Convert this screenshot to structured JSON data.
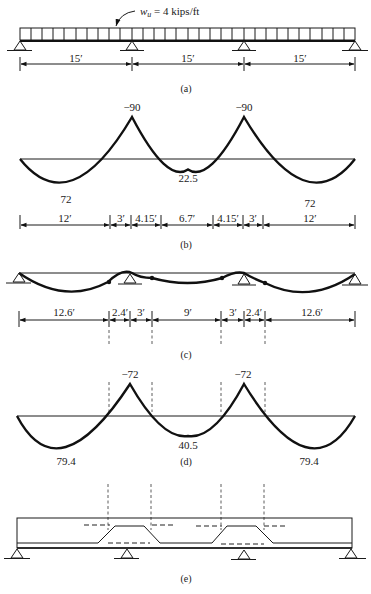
{
  "figure": {
    "a": {
      "caption": "(a)",
      "load_label_w": "w",
      "load_label_sub": "u",
      "load_label_rest": " = 4 kips/ft",
      "spans": [
        "15′",
        "15′",
        "15′"
      ]
    },
    "b": {
      "caption": "(b)",
      "moments": {
        "support_left": "−90",
        "support_right": "−90",
        "span_end_left": "72",
        "span_mid": "22.5",
        "span_end_right": "72"
      },
      "dims": [
        "12′",
        "3′",
        "4.15′",
        "6.7′",
        "4.15′",
        "3′",
        "12′"
      ]
    },
    "c": {
      "caption": "(c)",
      "dims": [
        "12.6′",
        "2.4′",
        "3′",
        "9′",
        "3′",
        "2.4′",
        "12.6′"
      ]
    },
    "d": {
      "caption": "(d)",
      "moments": {
        "support_left": "−72",
        "support_right": "−72",
        "span_end_left": "79.4",
        "span_mid": "40.5",
        "span_end_right": "79.4"
      }
    },
    "e": {
      "caption": "(e)"
    }
  }
}
